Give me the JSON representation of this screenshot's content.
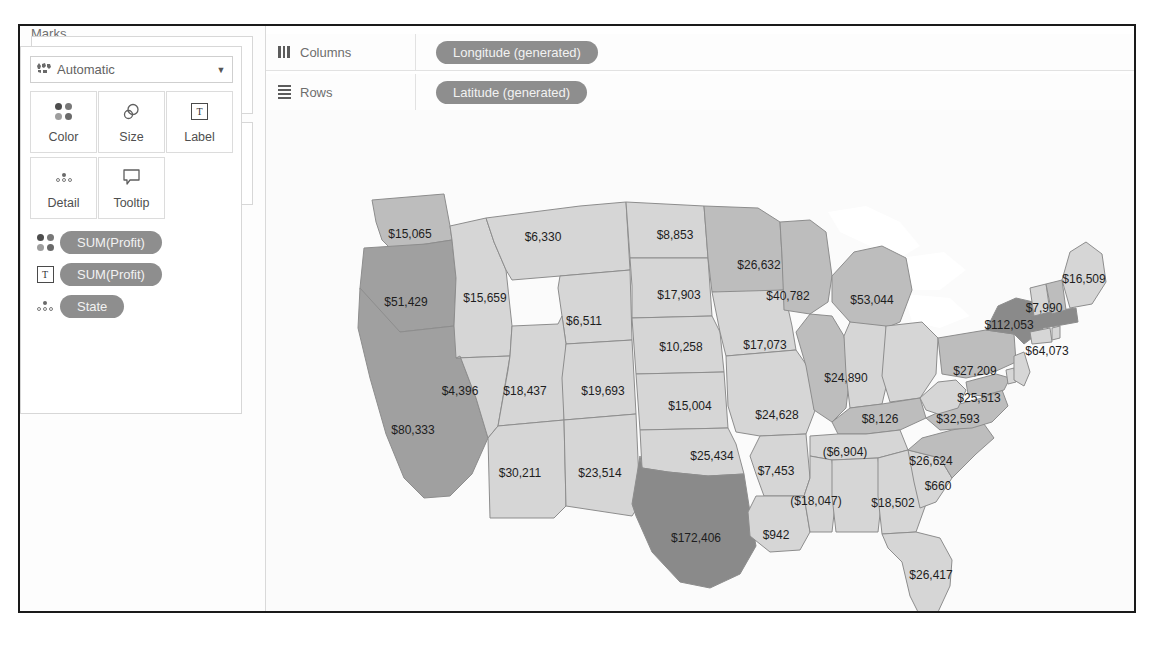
{
  "window": {
    "title": "Tableau Worksheet - Profit by State Map"
  },
  "sidebar": {
    "pages": {
      "title": "Pages"
    },
    "filters": {
      "title": "Filters"
    },
    "marks": {
      "title": "Marks",
      "mark_type": "Automatic",
      "mark_type_icon": "map-marks-icon",
      "caret_icon": "chevron-down-icon",
      "encodings": [
        {
          "label": "Color",
          "icon": "color-dots-icon"
        },
        {
          "label": "Size",
          "icon": "size-circles-icon"
        },
        {
          "label": "Label",
          "icon": "label-text-icon"
        },
        {
          "label": "Detail",
          "icon": "detail-dots-icon"
        },
        {
          "label": "Tooltip",
          "icon": "tooltip-bubble-icon"
        }
      ],
      "pills": [
        {
          "label": "SUM(Profit)",
          "icon": "color-dots-icon"
        },
        {
          "label": "SUM(Profit)",
          "icon": "label-text-icon"
        },
        {
          "label": "State",
          "icon": "detail-dots-icon"
        }
      ]
    }
  },
  "shelves": {
    "columns": {
      "label": "Columns",
      "icon": "columns-icon",
      "pill": "Longitude (generated)"
    },
    "rows": {
      "label": "Rows",
      "icon": "rows-icon",
      "pill": "Latitude (generated)"
    }
  },
  "colors": {
    "pill": "#8e8e8e",
    "pill_text": "#f2f2f2",
    "frame": "#1a1a1a",
    "map_light": "#d6d6d6",
    "map_mid": "#bdbdbd",
    "map_dark": "#a0a0a0",
    "map_darkest": "#8a8a8a",
    "map_border": "#8d8d8d",
    "water": "#ffffff",
    "label_text": "#1d1d1d"
  },
  "chart_data": {
    "type": "map",
    "measure": "SUM(Profit)",
    "dimension": "State",
    "value_prefix": "$",
    "negatives_in_parentheses": true,
    "marks": [
      {
        "state": "Washington",
        "label": "$15,065",
        "value": 15065,
        "x": 390,
        "y": 209,
        "shade": "mid"
      },
      {
        "state": "Montana",
        "label": "$6,330",
        "value": 6330,
        "x": 523,
        "y": 212,
        "shade": "light"
      },
      {
        "state": "North Dakota",
        "label": "$8,853",
        "value": 8853,
        "x": 655,
        "y": 210,
        "shade": "light"
      },
      {
        "state": "Minnesota",
        "label": "$26,632",
        "value": 26632,
        "x": 739,
        "y": 240,
        "shade": "mid"
      },
      {
        "state": "Maine",
        "label": "$16,509",
        "value": 16509,
        "x": 1064,
        "y": 254,
        "shade": "light"
      },
      {
        "state": "Oregon",
        "label": "$51,429",
        "value": 51429,
        "x": 386,
        "y": 277,
        "shade": "dark"
      },
      {
        "state": "Idaho",
        "label": "$15,659",
        "value": 15659,
        "x": 465,
        "y": 273,
        "shade": "light"
      },
      {
        "state": "South Dakota",
        "label": "$17,903",
        "value": 17903,
        "x": 659,
        "y": 270,
        "shade": "light"
      },
      {
        "state": "Wisconsin",
        "label": "$40,782",
        "value": 40782,
        "x": 768,
        "y": 271,
        "shade": "mid"
      },
      {
        "state": "Michigan",
        "label": "$53,044",
        "value": 53044,
        "x": 852,
        "y": 275,
        "shade": "mid"
      },
      {
        "state": "New Hampshire",
        "label": "$7,990",
        "value": 7990,
        "x": 1024,
        "y": 283,
        "shade": "mid"
      },
      {
        "state": "Wyoming",
        "label": "$6,511",
        "value": 6511,
        "x": 564,
        "y": 296,
        "shade": "light"
      },
      {
        "state": "New York",
        "label": "$112,053",
        "value": 112053,
        "x": 989,
        "y": 300,
        "shade": "darkest"
      },
      {
        "state": "Nebraska",
        "label": "$10,258",
        "value": 10258,
        "x": 661,
        "y": 322,
        "shade": "light"
      },
      {
        "state": "Iowa",
        "label": "$17,073",
        "value": 17073,
        "x": 745,
        "y": 320,
        "shade": "light"
      },
      {
        "state": "Massachusetts",
        "label": "$64,073",
        "value": 64073,
        "x": 1027,
        "y": 326,
        "shade": "darkest"
      },
      {
        "state": "Pennsylvania",
        "label": "$27,209",
        "value": 27209,
        "x": 955,
        "y": 346,
        "shade": "mid"
      },
      {
        "state": "Nevada",
        "label": "$4,396",
        "value": 4396,
        "x": 440,
        "y": 366,
        "shade": "light"
      },
      {
        "state": "Utah",
        "label": "$18,437",
        "value": 18437,
        "x": 505,
        "y": 366,
        "shade": "light"
      },
      {
        "state": "Colorado",
        "label": "$19,693",
        "value": 19693,
        "x": 583,
        "y": 366,
        "shade": "light"
      },
      {
        "state": "Illinois",
        "label": "$24,890",
        "value": 24890,
        "x": 826,
        "y": 353,
        "shade": "mid"
      },
      {
        "state": "California",
        "label": "$80,333",
        "value": 80333,
        "x": 393,
        "y": 405,
        "shade": "dark"
      },
      {
        "state": "Kansas",
        "label": "$15,004",
        "value": 15004,
        "x": 670,
        "y": 381,
        "shade": "light"
      },
      {
        "state": "Missouri",
        "label": "$24,628",
        "value": 24628,
        "x": 757,
        "y": 390,
        "shade": "light"
      },
      {
        "state": "Maryland",
        "label": "$25,513",
        "value": 25513,
        "x": 959,
        "y": 373,
        "shade": "mid"
      },
      {
        "state": "Kentucky",
        "label": "$8,126",
        "value": 8126,
        "x": 860,
        "y": 394,
        "shade": "mid"
      },
      {
        "state": "Virginia",
        "label": "$32,593",
        "value": 32593,
        "x": 938,
        "y": 394,
        "shade": "mid"
      },
      {
        "state": "Arizona",
        "label": "$30,211",
        "value": 30211,
        "x": 500,
        "y": 448,
        "shade": "light"
      },
      {
        "state": "New Mexico",
        "label": "$23,514",
        "value": 23514,
        "x": 580,
        "y": 448,
        "shade": "light"
      },
      {
        "state": "Oklahoma",
        "label": "$25,434",
        "value": 25434,
        "x": 692,
        "y": 431,
        "shade": "light"
      },
      {
        "state": "Arkansas",
        "label": "$7,453",
        "value": 7453,
        "x": 756,
        "y": 446,
        "shade": "light"
      },
      {
        "state": "Tennessee",
        "label": "($6,904)",
        "value": -6904,
        "x": 825,
        "y": 427,
        "shade": "light"
      },
      {
        "state": "North Carolina",
        "label": "$26,624",
        "value": 26624,
        "x": 911,
        "y": 436,
        "shade": "mid"
      },
      {
        "state": "South Carolina",
        "label": "$660",
        "value": 660,
        "x": 918,
        "y": 461,
        "shade": "light"
      },
      {
        "state": "Mississippi",
        "label": "($18,047)",
        "value": -18047,
        "x": 796,
        "y": 476,
        "shade": "light"
      },
      {
        "state": "Georgia",
        "label": "$18,502",
        "value": 18502,
        "x": 873,
        "y": 478,
        "shade": "light"
      },
      {
        "state": "Texas",
        "label": "$172,406",
        "value": 172406,
        "x": 676,
        "y": 513,
        "shade": "darkest"
      },
      {
        "state": "Louisiana",
        "label": "$942",
        "value": 942,
        "x": 756,
        "y": 510,
        "shade": "light"
      },
      {
        "state": "Florida",
        "label": "$26,417",
        "value": 26417,
        "x": 911,
        "y": 550,
        "shade": "light"
      }
    ]
  }
}
